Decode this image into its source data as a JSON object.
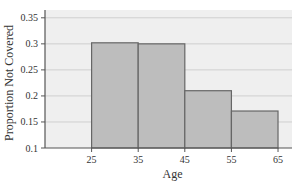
{
  "chart_data": {
    "type": "bar",
    "subtype": "histogram",
    "title": "",
    "xlabel": "Age",
    "ylabel": "Proportion Not Covered",
    "bin_edges": [
      25,
      35,
      45,
      55,
      65
    ],
    "categories": [
      "25-35",
      "35-45",
      "45-55",
      "55-65"
    ],
    "values": [
      0.302,
      0.3,
      0.21,
      0.171
    ],
    "xticks": [
      25,
      35,
      45,
      55,
      65
    ],
    "yticks": [
      0.1,
      0.15,
      0.2,
      0.25,
      0.3,
      0.35
    ],
    "ytick_labels": [
      "0.1",
      "0.15",
      "0.2",
      "0.25",
      "0.3",
      "0.35"
    ],
    "xlim": [
      15,
      68
    ],
    "ylim": [
      0.1,
      0.365
    ],
    "grid": "horizontal",
    "legend": null
  },
  "colors": {
    "plot_background": "#efefef",
    "bar_fill": "#bdbdbd",
    "bar_edge": "#666666",
    "gridline": "#cfcfcf",
    "axis": "#555555",
    "text": "#333333"
  }
}
